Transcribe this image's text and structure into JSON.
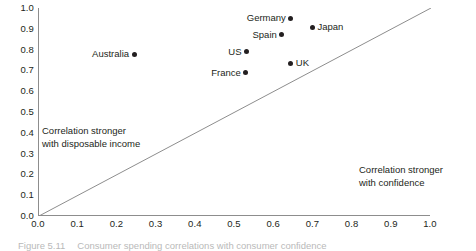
{
  "figure": {
    "caption_number": "Figure 5.11",
    "caption_text": "Consumer spending correlations with consumer confidence"
  },
  "chart_data": {
    "type": "scatter",
    "title": "",
    "xlabel": "",
    "ylabel": "",
    "xlim": [
      0.0,
      1.0
    ],
    "ylim": [
      0.0,
      1.0
    ],
    "grid": false,
    "legend": "none",
    "xticks": [
      "0.0",
      "0.1",
      "0.2",
      "0.3",
      "0.4",
      "0.5",
      "0.6",
      "0.7",
      "0.8",
      "0.9",
      "1.0"
    ],
    "yticks": [
      "0.0",
      "0.1",
      "0.2",
      "0.3",
      "0.4",
      "0.5",
      "0.6",
      "0.7",
      "0.8",
      "0.9",
      "1.0"
    ],
    "points": [
      {
        "label": "Germany",
        "x": 0.645,
        "y": 0.95,
        "label_side": "left"
      },
      {
        "label": "Japan",
        "x": 0.7,
        "y": 0.908,
        "label_side": "right"
      },
      {
        "label": "Spain",
        "x": 0.622,
        "y": 0.872,
        "label_side": "left"
      },
      {
        "label": "US",
        "x": 0.532,
        "y": 0.79,
        "label_side": "left"
      },
      {
        "label": "Australia",
        "x": 0.245,
        "y": 0.778,
        "label_side": "left"
      },
      {
        "label": "UK",
        "x": 0.645,
        "y": 0.735,
        "label_side": "right"
      },
      {
        "label": "France",
        "x": 0.53,
        "y": 0.688,
        "label_side": "left"
      }
    ],
    "reference_line": {
      "name": "45-degree-line",
      "from": [
        0.0,
        0.0
      ],
      "to": [
        1.0,
        1.0
      ]
    },
    "annotations": [
      {
        "name": "annotation-left",
        "line1": "Correlation stronger",
        "line2": "with disposable income"
      },
      {
        "name": "annotation-right",
        "line1": "Correlation stronger",
        "line2": "with confidence"
      }
    ],
    "colors": {
      "marker": "#231f20",
      "line": "#8d8d8d",
      "axis": "#8d8d8d",
      "text": "#231f20"
    }
  }
}
